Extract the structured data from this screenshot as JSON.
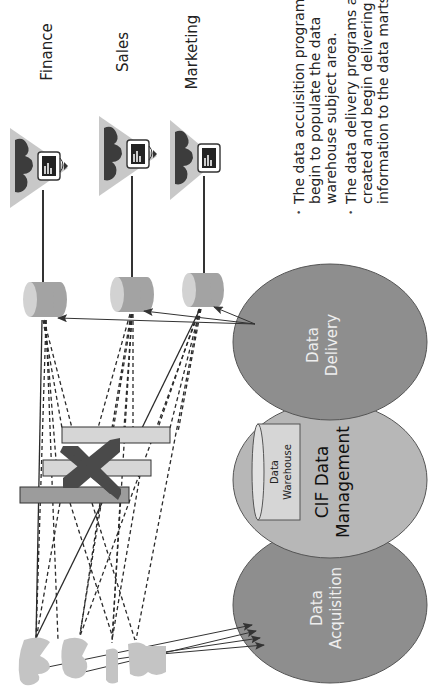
{
  "diagram": {
    "orientation": "rotated-90-clockwise",
    "colors": {
      "oval_dark": "#8e8e8e",
      "oval_light": "#b7b7b7",
      "cylinder": "#a3a3a3",
      "cylinder_cap": "#d2d2d2",
      "bar_light": "#d6d6d6",
      "bar_dark": "#9c9c9c",
      "x_mark": "#4a4a4a",
      "source_shape": "#c4c4c4",
      "triangle": "#c8c8c8",
      "line": "#2a2a2a"
    },
    "data_marts": [
      {
        "label": "Finance"
      },
      {
        "label": "Sales"
      },
      {
        "label": "Marketing"
      }
    ],
    "processes": {
      "delivery": {
        "line1": "Data",
        "line2": "Delivery"
      },
      "management": {
        "line1": "CIF Data",
        "line2": "Management"
      },
      "acquisition": {
        "line1": "Data",
        "line2": "Acquisition"
      }
    },
    "warehouse": {
      "line1": "Data",
      "line2": "Warehouse"
    },
    "bullets": [
      {
        "lines": [
          "The data accuisition programs",
          "begin to populate the data",
          "warehouse subject area."
        ]
      },
      {
        "lines": [
          "The data delivery programs are",
          "created and begin delivering",
          "information to the data marts."
        ]
      }
    ],
    "bullet_symbol": "•"
  }
}
